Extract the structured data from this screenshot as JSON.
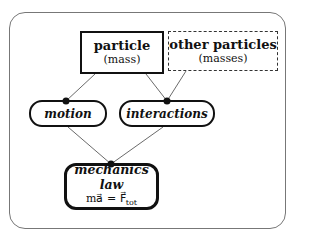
{
  "diagram": {
    "nodes": {
      "particle": {
        "title": "particle",
        "subtitle": "(mass)"
      },
      "other_particles": {
        "title": "other particles",
        "subtitle": "(masses)"
      },
      "motion": {
        "title": "motion"
      },
      "interactions": {
        "title": "interactions"
      },
      "mechanics_law": {
        "title": "mechanics law",
        "formula_left": "ma⃗ = F⃗",
        "formula_sub": "tot"
      }
    },
    "edges": [
      [
        "particle",
        "motion"
      ],
      [
        "particle",
        "interactions"
      ],
      [
        "other_particles",
        "interactions"
      ],
      [
        "motion",
        "mechanics_law"
      ],
      [
        "interactions",
        "mechanics_law"
      ]
    ]
  }
}
